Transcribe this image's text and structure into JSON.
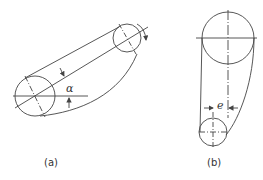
{
  "figure_a": {
    "caption": "(a)",
    "angle_symbol": "α",
    "large_pulley": {
      "cx": 35,
      "cy": 96,
      "r": 20
    },
    "small_pulley": {
      "cx": 127,
      "cy": 38,
      "r": 14
    }
  },
  "figure_b": {
    "caption": "(b)",
    "offset_symbol": "e",
    "large_pulley": {
      "cx": 228,
      "cy": 38,
      "r": 26
    },
    "small_pulley": {
      "cx": 213,
      "cy": 132,
      "r": 14
    }
  },
  "colors": {
    "stroke": "#444444",
    "background": "#ffffff"
  }
}
